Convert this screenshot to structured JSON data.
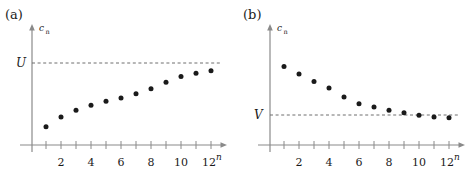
{
  "figure": {
    "panels": [
      {
        "id": "a",
        "label": "(a)",
        "yaxis_label_main": "c",
        "yaxis_label_sub": "n",
        "xaxis_label": "n",
        "limit_label": "U",
        "caption_note": "increasing sequence bounded above by U"
      },
      {
        "id": "b",
        "label": "(b)",
        "yaxis_label_main": "c",
        "yaxis_label_sub": "n",
        "xaxis_label": "n",
        "limit_label": "V",
        "caption_note": "decreasing sequence bounded below by V"
      }
    ],
    "tick_labels": [
      "2",
      "4",
      "6",
      "8",
      "10",
      "12"
    ]
  },
  "chart_data": [
    {
      "type": "scatter",
      "title": "(a)",
      "xlabel": "n",
      "ylabel": "c_n",
      "xlim": [
        0,
        13
      ],
      "ylim": [
        0,
        1.15
      ],
      "grid": false,
      "legend": null,
      "x": [
        1,
        2,
        3,
        4,
        5,
        6,
        7,
        8,
        9,
        10,
        11,
        12
      ],
      "values": [
        0.22,
        0.34,
        0.42,
        0.48,
        0.53,
        0.57,
        0.62,
        0.68,
        0.76,
        0.83,
        0.87,
        0.9
      ],
      "annotations": [
        {
          "type": "hline",
          "label": "U",
          "value": 1.0,
          "style": "dashed"
        }
      ],
      "xticks": [
        1,
        2,
        3,
        4,
        5,
        6,
        7,
        8,
        9,
        10,
        11,
        12
      ],
      "xticklabels": [
        "",
        "2",
        "",
        "4",
        "",
        "6",
        "",
        "8",
        "",
        "10",
        "",
        "12"
      ]
    },
    {
      "type": "scatter",
      "title": "(b)",
      "xlabel": "n",
      "ylabel": "c_n",
      "xlim": [
        0,
        13
      ],
      "ylim": [
        0,
        1.15
      ],
      "grid": false,
      "legend": null,
      "x": [
        1,
        2,
        3,
        4,
        5,
        6,
        7,
        8,
        9,
        10,
        11,
        12
      ],
      "values": [
        0.95,
        0.86,
        0.77,
        0.69,
        0.58,
        0.5,
        0.46,
        0.42,
        0.39,
        0.36,
        0.34,
        0.33
      ],
      "annotations": [
        {
          "type": "hline",
          "label": "V",
          "value": 0.3,
          "style": "dashed"
        }
      ],
      "xticks": [
        1,
        2,
        3,
        4,
        5,
        6,
        7,
        8,
        9,
        10,
        11,
        12
      ],
      "xticklabels": [
        "",
        "2",
        "",
        "4",
        "",
        "6",
        "",
        "8",
        "",
        "10",
        "",
        "12"
      ]
    }
  ],
  "colors": {
    "axis": "#8a8a8a",
    "point": "#1a1a1a",
    "dashed": "#6e6e6e",
    "text": "#1a1a1a",
    "background": "#ffffff"
  }
}
